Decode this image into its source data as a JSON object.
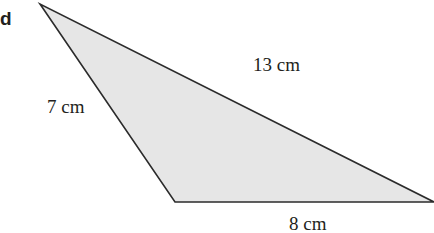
{
  "part_label": "d",
  "triangle": {
    "fill": "#e6e6e6",
    "stroke": "#2b2b2b",
    "sides": [
      {
        "name": "left",
        "label": "7 cm"
      },
      {
        "name": "hypotenuse",
        "label": "13 cm"
      },
      {
        "name": "bottom",
        "label": "8 cm"
      }
    ]
  }
}
